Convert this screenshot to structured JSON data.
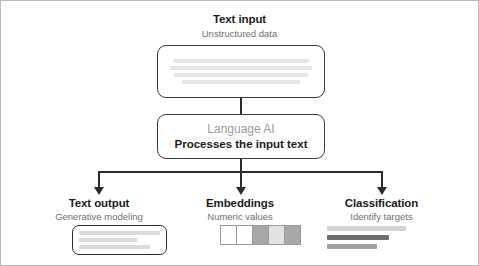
{
  "figure": {
    "border_color": "#b9b9b9",
    "background": "#ffffff"
  },
  "input_stage": {
    "title": "Text input",
    "subtitle": "Unstructured data",
    "box": {
      "name": "text-input-box",
      "placeholder_lines": 4,
      "line_color": "#e6e6e6"
    }
  },
  "model_stage": {
    "primary_label": "Language AI",
    "primary_color": "#9a9a9a",
    "secondary_label": "Processes the input text",
    "secondary_color": "#1b1b1b"
  },
  "outputs": [
    {
      "id": "text-output",
      "title": "Text output",
      "subtitle": "Generative modeling",
      "visual": "text-lines",
      "lines": [
        {
          "width_pct": 100,
          "color": "#dcdcdc"
        },
        {
          "width_pct": 72,
          "color": "#dcdcdc"
        },
        {
          "width_pct": 88,
          "color": "#dcdcdc"
        }
      ]
    },
    {
      "id": "embeddings",
      "title": "Embeddings",
      "subtitle": "Numeric values",
      "visual": "swatch-row",
      "cells": [
        "#ffffff",
        "#ffffff",
        "#a8a8a8",
        "#e2e2e2",
        "#a8a8a8"
      ]
    },
    {
      "id": "classification",
      "title": "Classification",
      "subtitle": "Identify targets",
      "visual": "bars",
      "bars": [
        {
          "width_pct": 100,
          "color": "#d4d4d4"
        },
        {
          "width_pct": 79,
          "color": "#6e6e6e"
        },
        {
          "width_pct": 63,
          "color": "#a0a0a0"
        }
      ]
    }
  ],
  "connectors": {
    "line_color": "#2b2b2b",
    "arrow_count": 3
  }
}
